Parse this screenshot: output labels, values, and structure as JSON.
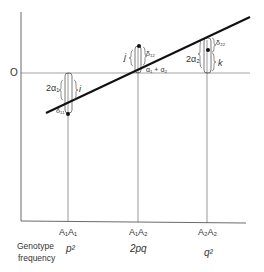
{
  "figure": {
    "zero_label": "O",
    "genotypes": [
      {
        "label": "A₁A₁",
        "frequency": "p²"
      },
      {
        "label": "A₁A₂",
        "frequency": "2pq"
      },
      {
        "label": "A₂A₂",
        "frequency": "q²"
      }
    ],
    "row_label_line1": "Genotype",
    "row_label_line2": "frequency",
    "annotations": {
      "two_alpha1": "2α₁",
      "i": "i",
      "delta11": "δ₁₁",
      "j": "j",
      "delta12": "δ₁₂",
      "alpha1_plus_alpha2": "α₁ + α₂",
      "two_alpha2": "2α₂",
      "delta22": "δ₂₂",
      "k": "k"
    },
    "colors": {
      "ink": "#1a1a1a",
      "thin": "#555555"
    }
  }
}
